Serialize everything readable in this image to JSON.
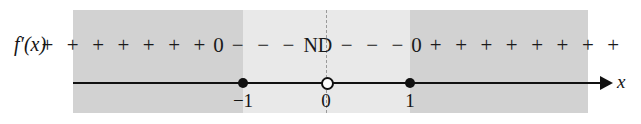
{
  "figure": {
    "function_label": "f′(x)",
    "axis_label": "x"
  },
  "chart_data": {
    "type": "table",
    "xlabel": "x",
    "ylabel": "f′(x)",
    "axis_arrow": "right",
    "grid": false,
    "legend": "none",
    "critical_points": [
      {
        "x": -1,
        "label": "−1",
        "marker": "filled-dot",
        "value": "0"
      },
      {
        "x": 0,
        "label": "0",
        "marker": "open-dot",
        "value": "ND"
      },
      {
        "x": 1,
        "label": "1",
        "marker": "filled-dot",
        "value": "0"
      }
    ],
    "intervals": [
      {
        "range": "(-∞, -1)",
        "sign": "+",
        "symbol_count": 7,
        "shade": "#d2d2d2"
      },
      {
        "range": "(-1, 0)",
        "sign": "−",
        "symbol_count": 3,
        "shade": "#e9e9e9"
      },
      {
        "range": "(0, 1)",
        "sign": "−",
        "symbol_count": 3,
        "shade": "#e9e9e9"
      },
      {
        "range": "(1, ∞)",
        "sign": "+",
        "symbol_count": 8,
        "shade": "#d2d2d2"
      }
    ],
    "sign_sequence": [
      "+",
      "+",
      "+",
      "+",
      "+",
      "+",
      "+",
      "0",
      "−",
      "−",
      "−",
      "ND",
      "−",
      "−",
      "−",
      "0",
      "+",
      "+",
      "+",
      "+",
      "+",
      "+",
      "+",
      "+"
    ],
    "markers": {
      "zero_left": "0",
      "undefined": "ND",
      "zero_right": "0"
    },
    "tick_labels": [
      "−1",
      "0",
      "1"
    ],
    "colors": {
      "band_outer": "#d2d2d2",
      "band_inner": "#e9e9e9",
      "ink": "#111111",
      "divider": "#9a9a9a",
      "background": "#ffffff"
    }
  }
}
